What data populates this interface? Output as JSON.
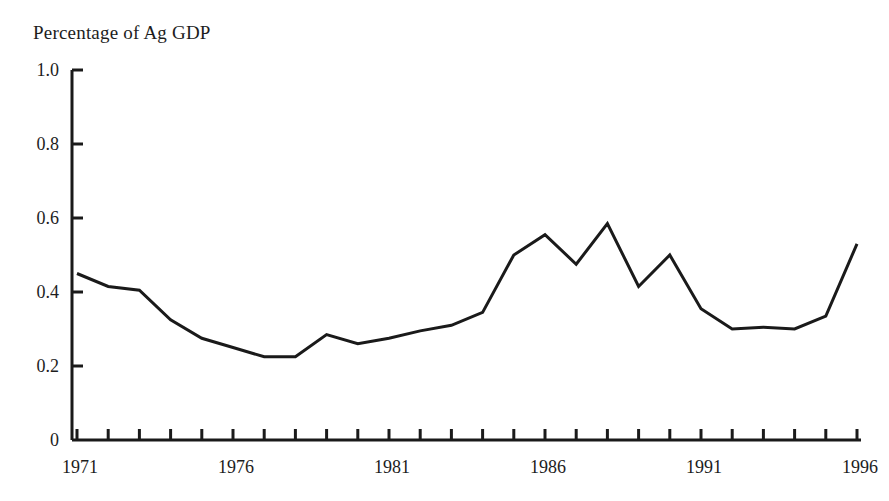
{
  "chart_data": {
    "type": "line",
    "title": "Percentage of Ag GDP",
    "xlabel": "",
    "ylabel": "Percentage of Ag GDP",
    "grid": false,
    "legend": null,
    "xlim": [
      1971,
      1996
    ],
    "ylim": [
      0,
      1.0
    ],
    "y_ticks": [
      0,
      0.2,
      0.4,
      0.6,
      0.8,
      1.0
    ],
    "y_tick_labels": [
      "0",
      "0.2",
      "0.4",
      "0.6",
      "0.8",
      "1.0"
    ],
    "x_ticks": [
      1971,
      1972,
      1973,
      1974,
      1975,
      1976,
      1977,
      1978,
      1979,
      1980,
      1981,
      1982,
      1983,
      1984,
      1985,
      1986,
      1987,
      1988,
      1989,
      1990,
      1991,
      1992,
      1993,
      1994,
      1995,
      1996
    ],
    "x_tick_labels": [
      "1971",
      "",
      "",
      "",
      "",
      "1976",
      "",
      "",
      "",
      "",
      "1981",
      "",
      "",
      "",
      "",
      "1986",
      "",
      "",
      "",
      "",
      "1991",
      "",
      "",
      "",
      "",
      "1996"
    ],
    "x_labeled_ticks": [
      "1971",
      "1976",
      "1981",
      "1986",
      "1991",
      "1996"
    ],
    "x": [
      1971,
      1972,
      1973,
      1974,
      1975,
      1976,
      1977,
      1978,
      1979,
      1980,
      1981,
      1982,
      1983,
      1984,
      1985,
      1986,
      1987,
      1988,
      1989,
      1990,
      1991,
      1992,
      1993,
      1994,
      1995,
      1996
    ],
    "values": [
      0.45,
      0.415,
      0.405,
      0.325,
      0.275,
      0.25,
      0.225,
      0.225,
      0.285,
      0.26,
      0.275,
      0.295,
      0.31,
      0.345,
      0.5,
      0.555,
      0.475,
      0.585,
      0.415,
      0.5,
      0.355,
      0.3,
      0.305,
      0.3,
      0.335,
      0.53
    ],
    "line_color": "#1a1a1a",
    "line_width": 3,
    "axis_color": "#1a1a1a",
    "background": "#ffffff"
  },
  "axis": {
    "title_text": "Percentage of Ag GDP"
  }
}
